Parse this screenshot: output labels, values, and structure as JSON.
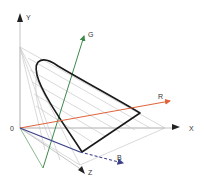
{
  "diagram": {
    "type": "color-space-3d",
    "labels": {
      "origin": "0",
      "x": "X",
      "y": "Y",
      "z": "Z",
      "r": "R",
      "g": "G",
      "b": "B"
    },
    "colors": {
      "axis": "#bdbdbd",
      "axis_arrow": "#222222",
      "r_vector": "#e0633a",
      "g_vector": "#3e8a4a",
      "b_vector": "#3a3f8a",
      "locus": "#1a1a1a",
      "grid": "#cfcfcf"
    }
  }
}
